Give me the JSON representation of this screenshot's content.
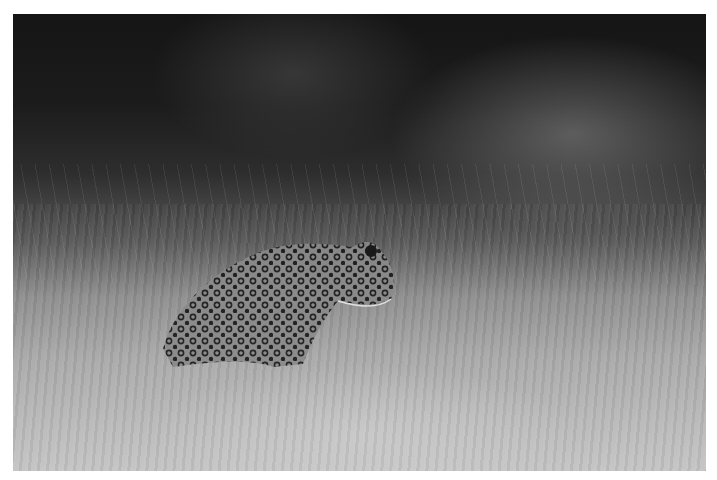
{
  "image": {
    "subject": "leopard",
    "description": "Black-and-white photograph of a spotted leopard standing in tall backlit grass, head turned to the right, dark background",
    "tone": "monochrome",
    "colors": {
      "background_dark": "#151515",
      "grass_light": "#b8b8b8",
      "frame": "#ffffff"
    }
  }
}
